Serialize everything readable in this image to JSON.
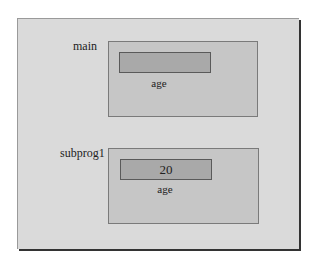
{
  "diagram": {
    "frames": [
      {
        "name": "main",
        "variable": {
          "name": "age",
          "value": ""
        }
      },
      {
        "name": "subprog1",
        "variable": {
          "name": "age",
          "value": "20"
        }
      }
    ]
  }
}
